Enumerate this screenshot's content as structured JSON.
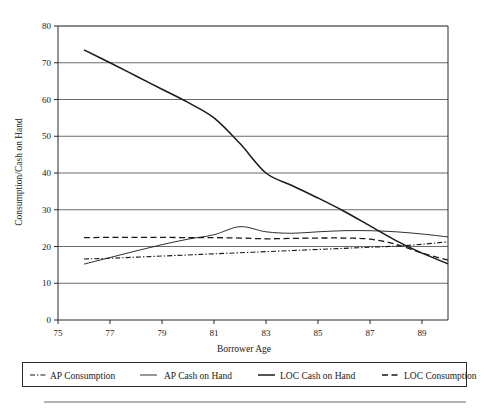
{
  "chart_data": {
    "type": "line",
    "title": "",
    "xlabel": "Borrower Age",
    "ylabel": "Consumption/Cash on Hand",
    "xlim": [
      75,
      90
    ],
    "ylim": [
      0,
      80
    ],
    "xticks": [
      "75",
      "77",
      "79",
      "81",
      "83",
      "85",
      "87",
      "89"
    ],
    "xtick_values": [
      75,
      77,
      79,
      81,
      83,
      85,
      87,
      89
    ],
    "yticks": [
      "0",
      "10",
      "20",
      "30",
      "40",
      "50",
      "60",
      "70",
      "80"
    ],
    "ytick_values": [
      0,
      10,
      20,
      30,
      40,
      50,
      60,
      70,
      80
    ],
    "grid": "horizontal",
    "legend_position": "below",
    "x": [
      76,
      77,
      78,
      79,
      80,
      81,
      82,
      83,
      84,
      85,
      86,
      87,
      88,
      89,
      90
    ],
    "series": [
      {
        "name": "AP Consumption",
        "style": "dash-dot",
        "values": [
          16.6,
          16.8,
          17.1,
          17.4,
          17.7,
          18.0,
          18.3,
          18.6,
          18.9,
          19.2,
          19.5,
          19.8,
          20.1,
          20.6,
          21.3
        ]
      },
      {
        "name": "AP Cash on Hand",
        "style": "solid-thin",
        "values": [
          15.2,
          17.0,
          18.8,
          20.5,
          22.0,
          23.2,
          25.4,
          24.0,
          23.6,
          24.0,
          24.3,
          24.3,
          24.0,
          23.4,
          22.6
        ]
      },
      {
        "name": "LOC Cash on Hand",
        "style": "solid",
        "values": [
          73.5,
          70.0,
          66.4,
          62.8,
          59.2,
          55.0,
          48.0,
          40.0,
          36.6,
          33.2,
          29.6,
          25.6,
          21.6,
          18.2,
          15.3
        ]
      },
      {
        "name": "LOC Consumption",
        "style": "dashed",
        "values": [
          22.4,
          22.5,
          22.5,
          22.5,
          22.4,
          22.4,
          22.3,
          22.1,
          22.2,
          22.3,
          22.3,
          22.0,
          20.6,
          18.2,
          16.3
        ]
      }
    ]
  },
  "legend": {
    "items": [
      {
        "label": "AP Consumption",
        "style": "dash-dot"
      },
      {
        "label": "AP Cash on Hand",
        "style": "solid-thin"
      },
      {
        "label": "LOC Cash on Hand",
        "style": "solid"
      },
      {
        "label": "LOC Consumption",
        "style": "dashed"
      }
    ]
  }
}
